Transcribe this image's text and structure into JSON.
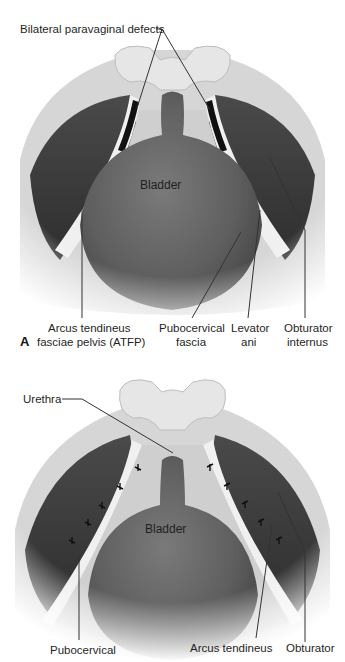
{
  "figure": {
    "panels": [
      {
        "letter": "A",
        "structure_label": "Bladder",
        "labels": {
          "top": "Bilateral paravaginal defects",
          "atfp_line1": "Arcus tendineus",
          "atfp_line2": "fasciae pelvis (ATFP)",
          "pubo_line1": "Pubocervical",
          "pubo_line2": "fascia",
          "levator_line1": "Levator",
          "levator_line2": "ani",
          "obturator_line1": "Obturator",
          "obturator_line2": "internus"
        }
      },
      {
        "letter": "",
        "structure_label": "Bladder",
        "labels": {
          "urethra": "Urethra",
          "pubo_line1": "Pubocervical",
          "arcus_line1": "Arcus tendineus",
          "obturator_line1": "Obturator"
        },
        "suture_count_left": 5,
        "suture_count_right": 5
      }
    ],
    "colors": {
      "background": "#ffffff",
      "bladder": "#6b6b6b",
      "muscle_dark": "#3a3a3a",
      "fascia_light": "#d9d9d9",
      "bone": "#e4e4e4",
      "leader_line": "#333333"
    }
  }
}
